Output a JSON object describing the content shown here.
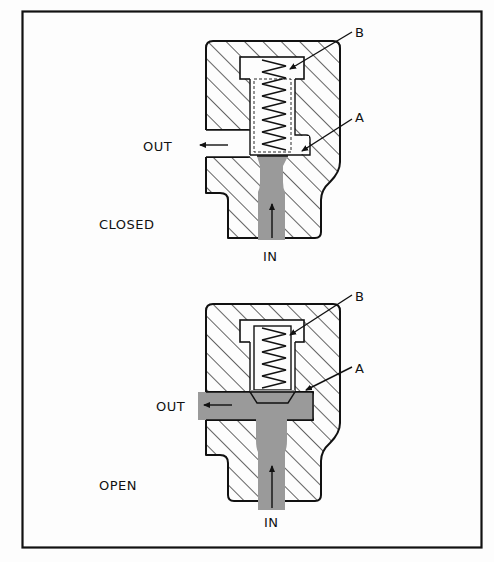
{
  "figure": {
    "frame_color": "#111111",
    "fluid_color": "#9a9a9a",
    "panels": [
      {
        "state_label": "CLOSED",
        "labels": {
          "top_part": "B",
          "seat_part": "A",
          "outlet": "OUT",
          "inlet": "IN"
        }
      },
      {
        "state_label": "OPEN",
        "labels": {
          "top_part": "B",
          "seat_part": "A",
          "outlet": "OUT",
          "inlet": "IN"
        }
      }
    ]
  }
}
